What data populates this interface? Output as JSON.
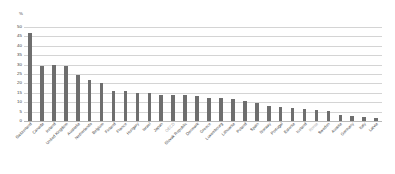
{
  "chart_data": {
    "type": "bar",
    "title": "",
    "subtitle": "",
    "xlabel": "",
    "ylabel": "",
    "unit_label": "%",
    "ylim": [
      0,
      50
    ],
    "yticks": [
      50,
      45,
      40,
      35,
      30,
      25,
      20,
      15,
      10,
      5,
      0
    ],
    "ytick_labels": [
      "50",
      "45",
      "40",
      "35",
      "30",
      "25",
      "20",
      "15",
      "10",
      "5",
      "0"
    ],
    "grid": true,
    "legend": null,
    "bar_color": "#6e6e6e",
    "highlight_label_color": "#a8a8a8",
    "categories": [
      "Switzerland",
      "Canada",
      "Ireland",
      "United Kingdom",
      "Australia",
      "Netherlands",
      "Belgium",
      "Finland",
      "France",
      "Hungary",
      "Israel",
      "Japan",
      "OECD",
      "Slovak Republic",
      "Denmark",
      "Greece",
      "Luxembourg",
      "Lithuania",
      "Poland",
      "Spain",
      "Norway",
      "Portugal",
      "Estonia",
      "Iceland",
      "Korea",
      "Sweden",
      "Austria",
      "Germany",
      "Italy",
      "Latvia"
    ],
    "values": [
      47.0,
      29.5,
      30.0,
      29.5,
      24.5,
      22.0,
      20.0,
      16.0,
      16.0,
      15.0,
      15.0,
      14.0,
      14.0,
      14.0,
      13.5,
      12.5,
      12.0,
      11.5,
      10.5,
      9.5,
      8.0,
      7.5,
      7.0,
      6.5,
      6.0,
      5.5,
      3.0,
      2.5,
      2.0,
      1.5
    ],
    "muted_categories": [
      "OECD",
      "Korea"
    ]
  }
}
